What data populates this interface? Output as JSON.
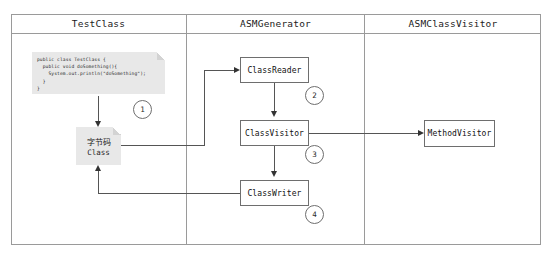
{
  "diagram": {
    "lanes": [
      {
        "label": "TestClass"
      },
      {
        "label": "ASMGenerator"
      },
      {
        "label": "ASMClassVisitor"
      }
    ],
    "code_note": {
      "name": "java-source-note",
      "lines": [
        "public class TestClass {",
        "  public void doSomething(){",
        "    System.out.println(\"doSomething\");",
        "  }",
        "}"
      ]
    },
    "bytecode_note": {
      "line1": "字节码",
      "line2": "Class"
    },
    "nodes": [
      {
        "id": "classreader",
        "label": "ClassReader"
      },
      {
        "id": "classvisitor",
        "label": "ClassVisitor"
      },
      {
        "id": "classwriter",
        "label": "ClassWriter"
      },
      {
        "id": "methodvisitor",
        "label": "MethodVisitor"
      }
    ],
    "step_badges": [
      {
        "id": "badge-1",
        "label": "1"
      },
      {
        "id": "badge-2",
        "label": "2"
      },
      {
        "id": "badge-3",
        "label": "3"
      },
      {
        "id": "badge-4",
        "label": "4"
      }
    ],
    "colors": {
      "note_fill": "#e8e8e8",
      "box_stroke": "#6e6e6e",
      "frame_stroke": "#9a9a9a",
      "connector": "#555555",
      "background": "#ffffff"
    }
  }
}
